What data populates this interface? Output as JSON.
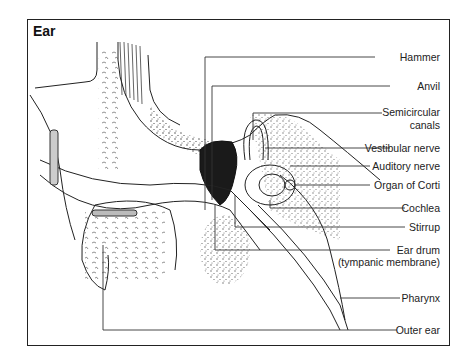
{
  "figure": {
    "title": "Ear",
    "labels": [
      {
        "id": "hammer",
        "text": "Hammer"
      },
      {
        "id": "anvil",
        "text": "Anvil"
      },
      {
        "id": "semicircular",
        "text": "Semicircular",
        "text2": "canals"
      },
      {
        "id": "vestibular",
        "text": "Vestibular  nerve"
      },
      {
        "id": "auditory",
        "text": "Auditory nerve"
      },
      {
        "id": "corti",
        "text": "Organ  of Corti"
      },
      {
        "id": "cochlea",
        "text": "Cochlea"
      },
      {
        "id": "stirrup",
        "text": "Stirrup"
      },
      {
        "id": "eardrum",
        "text": "Ear drum",
        "text2": "(tympanic membrane)"
      },
      {
        "id": "pharynx",
        "text": "Pharynx"
      },
      {
        "id": "outer",
        "text": "Outer ear"
      }
    ]
  },
  "colors": {
    "ink": "#222222",
    "background": "#ffffff"
  }
}
